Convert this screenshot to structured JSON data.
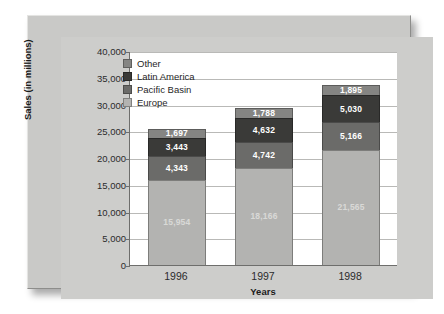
{
  "chart_data": {
    "type": "bar",
    "stacked": true,
    "title": "",
    "xlabel": "Years",
    "ylabel": "Sales (in millions)",
    "categories": [
      "1996",
      "1997",
      "1998"
    ],
    "ylim": [
      0,
      40000
    ],
    "ytick_labels": [
      "0",
      "5,000",
      "10,000",
      "15,000",
      "20,000",
      "25,000",
      "30,000",
      "35,000",
      "40,000"
    ],
    "ytick_values": [
      0,
      5000,
      10000,
      15000,
      20000,
      25000,
      30000,
      35000,
      40000
    ],
    "grid": true,
    "legend_position": "top-left",
    "series": [
      {
        "name": "Europe",
        "color": "#b3b3b1",
        "values": [
          15954,
          18166,
          21565
        ],
        "labels": [
          "15,954",
          "18,166",
          "21,565"
        ]
      },
      {
        "name": "Pacific Basin",
        "color": "#6b6b69",
        "values": [
          4343,
          4742,
          5166
        ],
        "labels": [
          "4,343",
          "4,742",
          "5,166"
        ]
      },
      {
        "name": "Latin America",
        "color": "#3a3a38",
        "values": [
          3443,
          4632,
          5030
        ],
        "labels": [
          "3,443",
          "4,632",
          "5,030"
        ]
      },
      {
        "name": "Other",
        "color": "#858583",
        "values": [
          1697,
          1788,
          1895
        ],
        "labels": [
          "1,697",
          "1,788",
          "1,895"
        ]
      }
    ],
    "legend_order": [
      "Other",
      "Latin America",
      "Pacific Basin",
      "Europe"
    ],
    "totals": [
      25437,
      29328,
      33656
    ]
  },
  "colors": {
    "frame": "#c9c9c7",
    "plot_background": "#ffffff",
    "axis": "#6e6e6c",
    "gridline": "#b9b9b7"
  }
}
